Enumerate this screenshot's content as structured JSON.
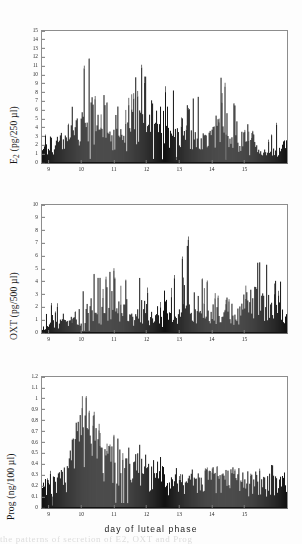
{
  "figure": {
    "xaxis_caption": "day of luteal phase",
    "caption_bleed": "the patterns of secretion of E2, OXT and Prog"
  },
  "panels": [
    {
      "id": "e2",
      "ylabel_main": "E",
      "ylabel_sub": "2",
      "ylabel_units": " (pg/250 µl)"
    },
    {
      "id": "oxt",
      "ylabel_main": "OXT",
      "ylabel_sub": "",
      "ylabel_units": " (pg/500 µl)"
    },
    {
      "id": "prog",
      "ylabel_main": "Prog",
      "ylabel_sub": "",
      "ylabel_units": " (ng/100 µl)"
    }
  ],
  "chart_data": [
    {
      "type": "bar",
      "id": "e2",
      "title": "",
      "xlabel": "day of luteal phase",
      "ylabel": "E2 (pg/250 µl)",
      "ylim": [
        0,
        15
      ],
      "yticks": [
        0,
        1,
        2,
        3,
        4,
        5,
        6,
        7,
        8,
        9,
        10,
        11,
        12,
        13,
        14,
        15
      ],
      "ytick_labels": [
        "0",
        "1",
        "2",
        "3",
        "4",
        "5",
        "6",
        "7",
        "8",
        "9",
        "10",
        "11",
        "12",
        "13",
        "14",
        "15"
      ],
      "xlim": [
        8.8,
        16.3
      ],
      "xticks": [
        9,
        10,
        11,
        12,
        13,
        14,
        15
      ],
      "xtick_labels": [
        "9",
        "10",
        "11",
        "12",
        "13",
        "14",
        "15"
      ],
      "grid": false,
      "legend": false,
      "series_color": "#121212",
      "n_samples": 247,
      "envelope_note": "dense high-frequency pulsatile spikes sampled across days 9-16.3",
      "envelope_control_points": [
        {
          "x": 8.85,
          "mean": 1.8,
          "amp": 3.2
        },
        {
          "x": 9.2,
          "mean": 2.2,
          "amp": 4.6
        },
        {
          "x": 9.6,
          "mean": 2.4,
          "amp": 5.0
        },
        {
          "x": 10.05,
          "mean": 4.6,
          "amp": 14.2
        },
        {
          "x": 10.35,
          "mean": 3.6,
          "amp": 10.8
        },
        {
          "x": 10.8,
          "mean": 2.8,
          "amp": 7.0
        },
        {
          "x": 11.3,
          "mean": 2.6,
          "amp": 6.6
        },
        {
          "x": 11.75,
          "mean": 4.2,
          "amp": 12.2
        },
        {
          "x": 12.05,
          "mean": 4.0,
          "amp": 10.6
        },
        {
          "x": 12.45,
          "mean": 3.6,
          "amp": 10.4
        },
        {
          "x": 12.8,
          "mean": 3.2,
          "amp": 9.6
        },
        {
          "x": 13.2,
          "mean": 2.6,
          "amp": 6.4
        },
        {
          "x": 13.6,
          "mean": 2.4,
          "amp": 8.8
        },
        {
          "x": 14.05,
          "mean": 2.8,
          "amp": 9.2
        },
        {
          "x": 14.4,
          "mean": 3.2,
          "amp": 10.2
        },
        {
          "x": 14.8,
          "mean": 2.4,
          "amp": 7.6
        },
        {
          "x": 15.2,
          "mean": 1.6,
          "amp": 4.0
        },
        {
          "x": 15.7,
          "mean": 1.0,
          "amp": 2.4
        },
        {
          "x": 16.0,
          "mean": 1.4,
          "amp": 5.2
        },
        {
          "x": 16.3,
          "mean": 2.0,
          "amp": 7.4
        }
      ],
      "peak_max": 14.2,
      "peak_x": 10.05
    },
    {
      "type": "bar",
      "id": "oxt",
      "title": "",
      "xlabel": "day of luteal phase",
      "ylabel": "OXT (pg/500 µl)",
      "ylim": [
        0,
        10
      ],
      "yticks": [
        0,
        1,
        2,
        3,
        4,
        5,
        6,
        7,
        8,
        9,
        10
      ],
      "ytick_labels": [
        "0",
        "1",
        "2",
        "3",
        "4",
        "5",
        "6",
        "7",
        "8",
        "9",
        "10"
      ],
      "xlim": [
        8.8,
        16.3
      ],
      "xticks": [
        9,
        10,
        11,
        12,
        13,
        14,
        15
      ],
      "xtick_labels": [
        "9",
        "10",
        "11",
        "12",
        "13",
        "14",
        "15"
      ],
      "grid": false,
      "legend": false,
      "series_color": "#121212",
      "n_samples": 247,
      "envelope_note": "pulsatile oxytocin spikes, low at start, rising block after day 15",
      "envelope_control_points": [
        {
          "x": 8.85,
          "mean": 0.5,
          "amp": 1.3
        },
        {
          "x": 9.15,
          "mean": 0.7,
          "amp": 3.1
        },
        {
          "x": 9.5,
          "mean": 0.8,
          "amp": 2.4
        },
        {
          "x": 9.85,
          "mean": 0.7,
          "amp": 2.0
        },
        {
          "x": 10.1,
          "mean": 1.5,
          "amp": 5.3
        },
        {
          "x": 10.45,
          "mean": 1.4,
          "amp": 4.5
        },
        {
          "x": 10.8,
          "mean": 1.5,
          "amp": 5.2
        },
        {
          "x": 11.1,
          "mean": 1.5,
          "amp": 5.3
        },
        {
          "x": 11.5,
          "mean": 1.2,
          "amp": 4.3
        },
        {
          "x": 11.9,
          "mean": 1.3,
          "amp": 4.4
        },
        {
          "x": 12.3,
          "mean": 1.0,
          "amp": 3.4
        },
        {
          "x": 12.7,
          "mean": 1.1,
          "amp": 3.8
        },
        {
          "x": 13.0,
          "mean": 1.3,
          "amp": 6.0
        },
        {
          "x": 13.35,
          "mean": 1.6,
          "amp": 8.2
        },
        {
          "x": 13.7,
          "mean": 1.3,
          "amp": 4.6
        },
        {
          "x": 14.0,
          "mean": 1.1,
          "amp": 4.2
        },
        {
          "x": 14.3,
          "mean": 0.9,
          "amp": 2.6
        },
        {
          "x": 14.65,
          "mean": 0.8,
          "amp": 3.3
        },
        {
          "x": 15.0,
          "mean": 1.8,
          "amp": 4.6
        },
        {
          "x": 15.35,
          "mean": 2.3,
          "amp": 5.6
        },
        {
          "x": 15.7,
          "mean": 2.0,
          "amp": 5.5
        },
        {
          "x": 16.05,
          "mean": 1.9,
          "amp": 4.4
        },
        {
          "x": 16.3,
          "mean": 1.5,
          "amp": 3.2
        }
      ],
      "peak_max": 8.2,
      "peak_x": 13.35
    },
    {
      "type": "bar",
      "id": "prog",
      "title": "",
      "xlabel": "day of luteal phase",
      "ylabel": "Prog (ng/100 µl)",
      "ylim": [
        0,
        1.2
      ],
      "yticks": [
        0,
        0.1,
        0.2,
        0.3,
        0.4,
        0.5,
        0.6,
        0.7,
        0.8,
        0.9,
        1.0,
        1.1,
        1.2
      ],
      "ytick_labels": [
        "0",
        "0.1",
        "0.2",
        "0.3",
        "0.4",
        "0.5",
        "0.6",
        "0.7",
        "0.8",
        "0.9",
        "1",
        "1.1",
        "1.2"
      ],
      "xlim": [
        8.8,
        16.3
      ],
      "xticks": [
        9,
        10,
        11,
        12,
        13,
        14,
        15
      ],
      "xtick_labels": [
        "9",
        "10",
        "11",
        "12",
        "13",
        "14",
        "15"
      ],
      "grid": false,
      "legend": false,
      "series_color": "#121212",
      "n_samples": 247,
      "envelope_note": "broad filled progesterone peak near day 10 decaying to a low plateau after day 12.5",
      "envelope_control_points": [
        {
          "x": 8.85,
          "mean": 0.18,
          "amp": 0.3
        },
        {
          "x": 9.2,
          "mean": 0.22,
          "amp": 0.42
        },
        {
          "x": 9.55,
          "mean": 0.3,
          "amp": 0.52
        },
        {
          "x": 9.8,
          "mean": 0.48,
          "amp": 0.82
        },
        {
          "x": 10.0,
          "mean": 0.66,
          "amp": 1.15
        },
        {
          "x": 10.2,
          "mean": 0.62,
          "amp": 1.02
        },
        {
          "x": 10.45,
          "mean": 0.52,
          "amp": 0.88
        },
        {
          "x": 10.75,
          "mean": 0.44,
          "amp": 0.72
        },
        {
          "x": 11.0,
          "mean": 0.4,
          "amp": 0.7
        },
        {
          "x": 11.3,
          "mean": 0.38,
          "amp": 0.62
        },
        {
          "x": 11.65,
          "mean": 0.36,
          "amp": 0.6
        },
        {
          "x": 12.0,
          "mean": 0.34,
          "amp": 0.56
        },
        {
          "x": 12.4,
          "mean": 0.3,
          "amp": 0.48
        },
        {
          "x": 12.7,
          "mean": 0.22,
          "amp": 0.36
        },
        {
          "x": 13.1,
          "mean": 0.22,
          "amp": 0.38
        },
        {
          "x": 13.5,
          "mean": 0.24,
          "amp": 0.4
        },
        {
          "x": 13.9,
          "mean": 0.24,
          "amp": 0.42
        },
        {
          "x": 14.3,
          "mean": 0.26,
          "amp": 0.42
        },
        {
          "x": 14.7,
          "mean": 0.24,
          "amp": 0.38
        },
        {
          "x": 15.1,
          "mean": 0.2,
          "amp": 0.34
        },
        {
          "x": 15.5,
          "mean": 0.22,
          "amp": 0.38
        },
        {
          "x": 15.9,
          "mean": 0.24,
          "amp": 0.4
        },
        {
          "x": 16.3,
          "mean": 0.22,
          "amp": 0.36
        }
      ],
      "peak_max": 1.15,
      "peak_x": 10.05
    }
  ]
}
